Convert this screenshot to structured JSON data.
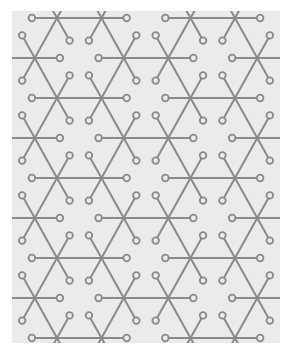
{
  "image": {
    "description": "Geometric circuit-like lattice pattern of six-armed junctions with hollow circle terminals on a light gray panel",
    "background_color": "#ffffff",
    "panel": {
      "x": 12,
      "y": 11,
      "width": 268,
      "height": 332,
      "color": "#ebebeb"
    },
    "pattern": {
      "stroke_color": "#8a8a8a",
      "stroke_width": 2,
      "circle_radius": 3.3,
      "circle_stroke_width": 1.8,
      "circle_fill": "#ebebeb",
      "lattice": {
        "origin_x": 12.5,
        "origin_y": 18,
        "dx": 44.5,
        "dy": 40,
        "rows": 9,
        "hole_rule": "row even: half-index mod 6 == 0; row odd: half-index mod 6 == 3"
      },
      "terminal_fraction": 0.565
    }
  }
}
